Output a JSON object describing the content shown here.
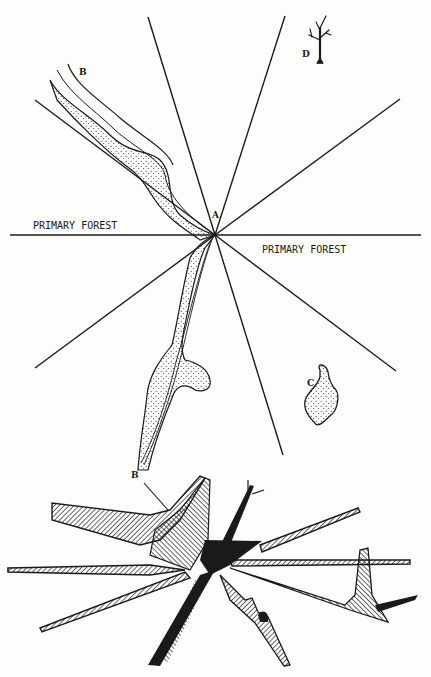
{
  "figure": {
    "plan_view": {
      "labels": {
        "primary_forest_left": "PRIMARY FOREST",
        "primary_forest_right": "PRIMARY FOREST",
        "point_a": "A",
        "stream_b_top": "B",
        "stream_b_bottom": "B",
        "patch_c": "C",
        "tree_d": "D"
      },
      "center_point": [
        215,
        235
      ],
      "rays": [
        [
          10,
          235,
          421,
          235
        ],
        [
          148,
          16,
          215,
          235
        ],
        [
          285,
          16,
          215,
          235
        ],
        [
          35,
          99,
          215,
          235
        ],
        [
          400,
          99,
          215,
          235
        ],
        [
          35,
          368,
          215,
          235
        ],
        [
          395,
          370,
          215,
          235
        ],
        [
          283,
          455,
          215,
          235
        ]
      ]
    },
    "profile_view": {
      "label_b": "B"
    },
    "colors": {
      "ink": "#1a1a1a",
      "paper": "#fdfdfb"
    }
  }
}
